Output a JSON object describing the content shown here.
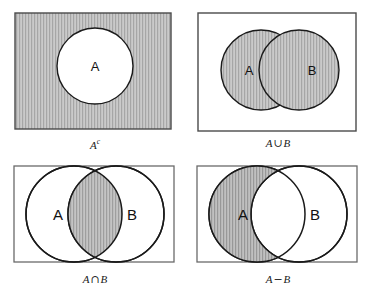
{
  "figure": {
    "background_color": "#ffffff",
    "stroke_color": "#1a1a1a",
    "shade_fill": "#c8c8c8",
    "hatch_color": "#a8a8a8",
    "rect_stroke_color": "#555555",
    "set_label_color": "#111111",
    "caption_color": "#1a1a1a"
  },
  "panels": [
    {
      "id": "complement",
      "operation": "complement",
      "caption_base": "A",
      "caption_sup": "c",
      "caption_plain": "A^c",
      "shaded_region": "outside-A-inside-universe",
      "labels": [
        {
          "name": "A",
          "text": "A"
        }
      ]
    },
    {
      "id": "union",
      "operation": "union",
      "caption_left": "A",
      "caption_operator": "∪",
      "caption_right": "B",
      "caption_plain": "A ∪ B",
      "shaded_region": "A-and-B-both-circles",
      "labels": [
        {
          "name": "A",
          "text": "A"
        },
        {
          "name": "B",
          "text": "B"
        }
      ]
    },
    {
      "id": "intersection",
      "operation": "intersection",
      "caption_left": "A",
      "caption_operator": "∩",
      "caption_right": "B",
      "caption_plain": "A ∩ B",
      "shaded_region": "lens-overlap-only",
      "labels": [
        {
          "name": "A",
          "text": "A"
        },
        {
          "name": "B",
          "text": "B"
        }
      ]
    },
    {
      "id": "difference",
      "operation": "difference",
      "caption_left": "A",
      "caption_operator": "−",
      "caption_right": "B",
      "caption_plain": "A − B",
      "shaded_region": "A-minus-overlap",
      "labels": [
        {
          "name": "A",
          "text": "A"
        },
        {
          "name": "B",
          "text": "B"
        }
      ]
    }
  ]
}
